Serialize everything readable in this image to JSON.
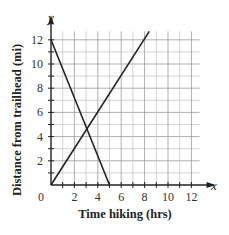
{
  "chart_data": {
    "type": "line",
    "title": "",
    "xlabel": "Time hiking (hrs)",
    "ylabel": "Distance from trailhead (mi)",
    "x_axis_letter": "x",
    "y_axis_letter": "y",
    "origin_label": "0",
    "xlim": [
      0,
      12.7
    ],
    "ylim": [
      0,
      12.7
    ],
    "x_ticks": [
      "2",
      "4",
      "6",
      "8",
      "10",
      "12"
    ],
    "y_ticks": [
      "2",
      "4",
      "6",
      "8",
      "10",
      "12"
    ],
    "grid": true,
    "legend": "none",
    "series": [
      {
        "name": "descending line",
        "points": [
          [
            0,
            12
          ],
          [
            5,
            0
          ]
        ]
      },
      {
        "name": "ascending line",
        "points": [
          [
            0,
            0
          ],
          [
            8.4,
            12.7
          ]
        ]
      }
    ],
    "intersection": [
      3.05,
      4.6
    ]
  }
}
